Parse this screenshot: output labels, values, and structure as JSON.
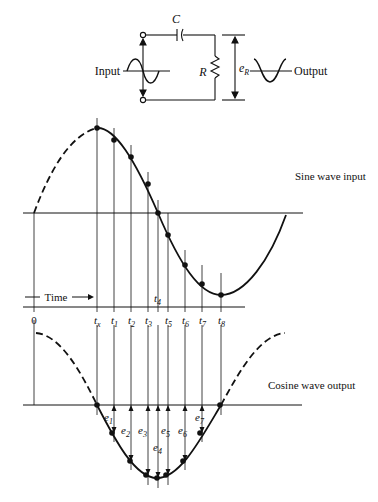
{
  "circuit": {
    "capacitor_label": "C",
    "resistor_label": "R",
    "voltage_label": "e",
    "voltage_sub": "R",
    "input_label": "Input",
    "output_label": "Output"
  },
  "sine_panel": {
    "title": "Sine wave input",
    "time_label": "Time",
    "axis_labels": {
      "origin": "0",
      "tx": "t",
      "tx_sub": "x"
    },
    "t4_label": "t",
    "t4_sub": "4",
    "ticks": [
      {
        "t": "t",
        "sub": "x"
      },
      {
        "t": "t",
        "sub": "1"
      },
      {
        "t": "t",
        "sub": "2"
      },
      {
        "t": "t",
        "sub": "3"
      },
      {
        "t": "t",
        "sub": "5"
      },
      {
        "t": "t",
        "sub": "6"
      },
      {
        "t": "t",
        "sub": "7"
      },
      {
        "t": "t",
        "sub": "8"
      }
    ]
  },
  "cosine_panel": {
    "title": "Cosine wave output",
    "e_labels": [
      {
        "t": "e",
        "sub": "1"
      },
      {
        "t": "e",
        "sub": "2"
      },
      {
        "t": "e",
        "sub": "3"
      },
      {
        "t": "e",
        "sub": "4"
      },
      {
        "t": "e",
        "sub": "5"
      },
      {
        "t": "e",
        "sub": "6"
      },
      {
        "t": "e",
        "sub": "7"
      }
    ]
  },
  "colors": {
    "ink": "#111111",
    "background": "#ffffff"
  }
}
